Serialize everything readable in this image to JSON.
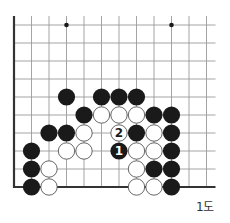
{
  "diagram": {
    "type": "go-board-fragment",
    "caption": "1도",
    "grid": {
      "origin_x": 14,
      "origin_y": 25,
      "col_spacing": 17.5,
      "row_spacing": 18,
      "cols": 12,
      "rows": 10,
      "line_extend_top": 9,
      "line_extend_right": 9,
      "edges": [
        "left",
        "bottom"
      ],
      "line_color": "#9a9a9a",
      "edge_color": "#333333"
    },
    "star_points": [
      {
        "col": 3,
        "row": 0
      },
      {
        "col": 9,
        "row": 0
      }
    ],
    "stone_radius": 8.6,
    "stones": [
      {
        "color": "black",
        "col": 3,
        "row": 4
      },
      {
        "color": "black",
        "col": 5,
        "row": 4
      },
      {
        "color": "black",
        "col": 6,
        "row": 4
      },
      {
        "color": "black",
        "col": 7,
        "row": 4
      },
      {
        "color": "black",
        "col": 4,
        "row": 5
      },
      {
        "color": "white",
        "col": 5,
        "row": 5
      },
      {
        "color": "white",
        "col": 6,
        "row": 5
      },
      {
        "color": "white",
        "col": 7,
        "row": 5
      },
      {
        "color": "black",
        "col": 8,
        "row": 5
      },
      {
        "color": "black",
        "col": 9,
        "row": 5
      },
      {
        "color": "black",
        "col": 2,
        "row": 6
      },
      {
        "color": "black",
        "col": 3,
        "row": 6
      },
      {
        "color": "white",
        "col": 4,
        "row": 6
      },
      {
        "color": "white",
        "col": 6,
        "row": 6,
        "label": "2"
      },
      {
        "color": "black",
        "col": 7,
        "row": 6
      },
      {
        "color": "white",
        "col": 8,
        "row": 6
      },
      {
        "color": "black",
        "col": 9,
        "row": 6
      },
      {
        "color": "black",
        "col": 1,
        "row": 7
      },
      {
        "color": "white",
        "col": 3,
        "row": 7
      },
      {
        "color": "white",
        "col": 4,
        "row": 7
      },
      {
        "color": "black",
        "col": 6,
        "row": 7,
        "label": "1"
      },
      {
        "color": "white",
        "col": 7,
        "row": 7
      },
      {
        "color": "white",
        "col": 8,
        "row": 7
      },
      {
        "color": "black",
        "col": 9,
        "row": 7
      },
      {
        "color": "black",
        "col": 1,
        "row": 8
      },
      {
        "color": "white",
        "col": 2,
        "row": 8
      },
      {
        "color": "white",
        "col": 7,
        "row": 8
      },
      {
        "color": "black",
        "col": 8,
        "row": 8
      },
      {
        "color": "black",
        "col": 9,
        "row": 8
      },
      {
        "color": "black",
        "col": 1,
        "row": 9
      },
      {
        "color": "white",
        "col": 2,
        "row": 9
      },
      {
        "color": "white",
        "col": 7,
        "row": 9
      },
      {
        "color": "white",
        "col": 8,
        "row": 9
      },
      {
        "color": "black",
        "col": 9,
        "row": 9
      }
    ],
    "colors": {
      "black_stone": "#1a1a1a",
      "white_stone_fill": "#ffffff",
      "white_stone_stroke": "#555555",
      "label_on_black": "#ffffff",
      "label_on_white": "#1a1a1a"
    }
  }
}
